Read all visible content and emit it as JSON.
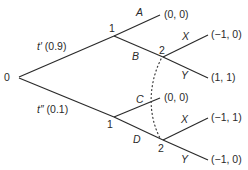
{
  "diagram": {
    "type": "extensive-form game tree",
    "root": {
      "label": "0",
      "x": 16,
      "y": 77
    },
    "nature_moves": [
      {
        "id": "t_prime",
        "label": "t′ (0.9)",
        "to": "n1_top"
      },
      {
        "id": "t_dprime",
        "label": "t″ (0.1)",
        "to": "n1_bottom"
      }
    ],
    "nodes": {
      "n1_top": {
        "player": "1",
        "x": 114,
        "y": 36
      },
      "n1_bottom": {
        "player": "1",
        "x": 114,
        "y": 117
      },
      "n2_top": {
        "player": "2",
        "x": 163,
        "y": 57
      },
      "n2_bottom": {
        "player": "2",
        "x": 163,
        "y": 140
      }
    },
    "actions": {
      "A": {
        "label": "A",
        "from": "n1_top",
        "payoff": "(0, 0)"
      },
      "B": {
        "label": "B",
        "from": "n1_top",
        "to": "n2_top"
      },
      "C": {
        "label": "C",
        "from": "n1_bottom",
        "payoff": "(0, 0)"
      },
      "D": {
        "label": "D",
        "from": "n1_bottom",
        "to": "n2_bottom"
      },
      "X_top": {
        "label": "X",
        "from": "n2_top",
        "payoff": "(−1, 0)"
      },
      "Y_top": {
        "label": "Y",
        "from": "n2_top",
        "payoff": "(1, 1)"
      },
      "X_bottom": {
        "label": "X",
        "from": "n2_bottom",
        "payoff": "(−1, 1)"
      },
      "Y_bottom": {
        "label": "Y",
        "from": "n2_bottom",
        "payoff": "(−1, 0)"
      }
    },
    "information_sets": [
      {
        "player": "2",
        "nodes": [
          "n2_top",
          "n2_bottom"
        ],
        "style": "dotted-curve"
      }
    ],
    "colors": {
      "line": "#2a2a2a",
      "text": "#2a2a2a",
      "background": "#ffffff"
    }
  }
}
